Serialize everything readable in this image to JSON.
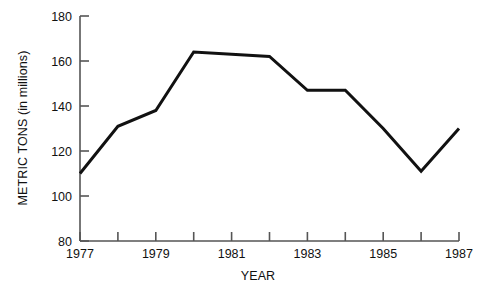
{
  "chart_data": {
    "type": "line",
    "title": "",
    "subtitle": "",
    "xlabel": "YEAR",
    "ylabel": "METRIC TONS (in millions)",
    "x": [
      1977,
      1978,
      1979,
      1980,
      1981,
      1982,
      1983,
      1984,
      1985,
      1986,
      1987
    ],
    "values": [
      110,
      131,
      138,
      164,
      163,
      162,
      147,
      147,
      130,
      111,
      130
    ],
    "series": [
      {
        "name": "Metric tons",
        "values": [
          110,
          131,
          138,
          164,
          163,
          162,
          147,
          147,
          130,
          111,
          130
        ]
      }
    ],
    "xlim": [
      1977,
      1987
    ],
    "ylim": [
      80,
      180
    ],
    "y_ticks": [
      80,
      100,
      120,
      140,
      160,
      180
    ],
    "y_tick_labels": [
      "80",
      "100",
      "120",
      "140",
      "160",
      "180"
    ],
    "x_ticks": [
      1977,
      1978,
      1979,
      1980,
      1981,
      1982,
      1983,
      1984,
      1985,
      1986,
      1987
    ],
    "x_tick_labels": [
      "1977",
      "",
      "1979",
      "",
      "1981",
      "",
      "1983",
      "",
      "1985",
      "",
      "1987"
    ],
    "x_labeled_ticks": [
      {
        "value": 1977,
        "label": "1977"
      },
      {
        "value": 1979,
        "label": "1979"
      },
      {
        "value": 1981,
        "label": "1981"
      },
      {
        "value": 1983,
        "label": "1983"
      },
      {
        "value": 1985,
        "label": "1985"
      },
      {
        "value": 1987,
        "label": "1987"
      }
    ],
    "grid": false,
    "legend": null,
    "legend_position": "none",
    "line_color": "#111111",
    "line_width": 3,
    "axis_color": "#555555",
    "background_color": "#ffffff",
    "annotations": []
  },
  "axis_labels": {
    "x_axis_title": "YEAR",
    "y_axis_title": "METRIC TONS (in millions)"
  }
}
